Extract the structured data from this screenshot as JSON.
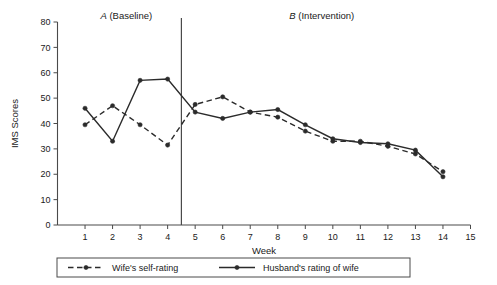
{
  "chart_data": {
    "type": "line",
    "title": "",
    "xlabel": "Week",
    "ylabel": "IMS Scores",
    "xlim": [
      0,
      15
    ],
    "ylim": [
      0,
      80
    ],
    "grid": false,
    "x": [
      1,
      2,
      3,
      4,
      5,
      6,
      7,
      8,
      9,
      10,
      11,
      12,
      13,
      14
    ],
    "xticks": [
      "1",
      "2",
      "3",
      "4",
      "5",
      "6",
      "7",
      "8",
      "9",
      "10",
      "11",
      "12",
      "13",
      "14",
      "15"
    ],
    "yticks": [
      "0",
      "10",
      "20",
      "30",
      "40",
      "50",
      "60",
      "70",
      "80"
    ],
    "legend_position": "bottom",
    "series": [
      {
        "name": "Wife's self-rating",
        "style": "dashed",
        "values": [
          39.5,
          47,
          39.5,
          31.5,
          47.5,
          50.5,
          44.5,
          42.5,
          37,
          33,
          33,
          31,
          28,
          21
        ]
      },
      {
        "name": "Husband's rating of wife",
        "style": "solid",
        "values": [
          46,
          33,
          57,
          57.5,
          44.5,
          42,
          44.5,
          45.5,
          39.5,
          34,
          32.5,
          32,
          29.5,
          19
        ]
      }
    ],
    "annotations": [
      {
        "name": "phase-a",
        "italic_part": "A",
        "rest": " (Baseline)",
        "x_center": 2.5
      },
      {
        "name": "phase-b",
        "italic_part": "B",
        "rest": " (Intervention)",
        "x_center": 9.6
      }
    ],
    "phase_divider_x": 4.5
  },
  "legend": {
    "items": [
      {
        "label": "Wife's self-rating",
        "style": "dashed"
      },
      {
        "label": "Husband's rating of wife",
        "style": "solid"
      }
    ]
  },
  "colors": {
    "line": "#2b2b2b",
    "axis": "#4a4a4a",
    "background": "#ffffff"
  }
}
